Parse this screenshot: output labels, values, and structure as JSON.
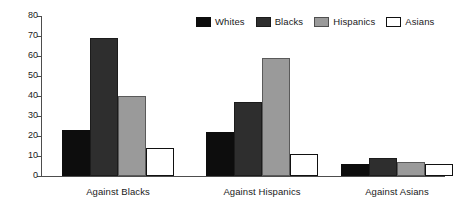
{
  "chart_data": {
    "type": "bar",
    "title": "",
    "subtitle": "",
    "xlabel": "",
    "ylabel": "",
    "ylim": [
      0,
      80
    ],
    "ytick_step": 10,
    "yticks": [
      "80",
      "70",
      "60",
      "50",
      "40",
      "30",
      "20",
      "10",
      "0"
    ],
    "grid": false,
    "legend_position": "top-right",
    "categories": [
      "Against Blacks",
      "Against Hispanics",
      "Against Asians"
    ],
    "series": [
      {
        "name": "Whites",
        "color": "#0d0d0d",
        "values": [
          23,
          22,
          6
        ]
      },
      {
        "name": "Blacks",
        "color": "#2e2e2e",
        "values": [
          69,
          37,
          9
        ]
      },
      {
        "name": "Hispanics",
        "color": "#9a9a9a",
        "values": [
          40,
          59,
          7
        ]
      },
      {
        "name": "Asians",
        "color": "#ffffff",
        "values": [
          14,
          11,
          6
        ]
      }
    ]
  },
  "legend": {
    "entries": [
      {
        "label": "Whites",
        "swatch": "legend-swatch-whites"
      },
      {
        "label": "Blacks",
        "swatch": "legend-swatch-blacks"
      },
      {
        "label": "Hispanics",
        "swatch": "legend-swatch-hispanics"
      },
      {
        "label": "Asians",
        "swatch": "legend-swatch-asians"
      }
    ]
  },
  "axes": {
    "y": {
      "max": 80,
      "min": 0,
      "step": 10
    }
  }
}
